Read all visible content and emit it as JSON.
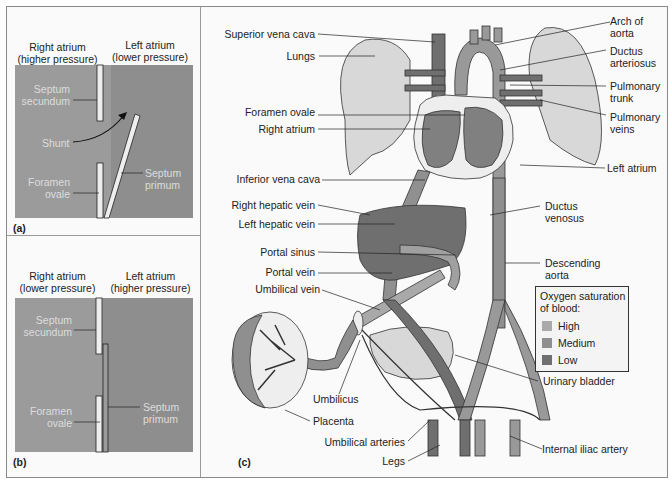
{
  "colors": {
    "high": "#a9a9a9",
    "medium": "#8f8f8f",
    "low": "#6f6f6f",
    "panel_bg_light": "#9d9d9d",
    "panel_bg_dark": "#858585",
    "lung": "#d8d8d8",
    "septum": "#eeeeee",
    "line": "#333333"
  },
  "panel_a": {
    "tag": "(a)",
    "right_atrium": [
      "Right atrium",
      "(higher pressure)"
    ],
    "left_atrium": [
      "Left atrium",
      "(lower pressure)"
    ],
    "septum_secundum": [
      "Septum",
      "secundum"
    ],
    "shunt": "Shunt",
    "foramen_ovale": [
      "Foramen",
      "ovale"
    ],
    "septum_primum": [
      "Septum",
      "primum"
    ]
  },
  "panel_b": {
    "tag": "(b)",
    "right_atrium": [
      "Right atrium",
      "(lower pressure)"
    ],
    "left_atrium": [
      "Left atrium",
      "(higher pressure)"
    ],
    "septum_secundum": [
      "Septum",
      "secundum"
    ],
    "foramen_ovale": [
      "Foramen",
      "ovale"
    ],
    "septum_primum": [
      "Septum",
      "primum"
    ]
  },
  "panel_c": {
    "tag": "(c)",
    "left_labels": {
      "superior_vena_cava": "Superior vena cava",
      "lungs": "Lungs",
      "foramen_ovale": "Foramen ovale",
      "right_atrium": "Right atrium",
      "inferior_vena_cava": "Inferior vena cava",
      "right_hepatic_vein": "Right hepatic vein",
      "left_hepatic_vein": "Left hepatic vein",
      "portal_sinus": "Portal sinus",
      "portal_vein": "Portal vein",
      "umbilical_vein": "Umbilical vein",
      "umbilicus": "Umbilicus",
      "placenta": "Placenta",
      "umbilical_arteries": "Umbilical arteries",
      "legs": "Legs"
    },
    "right_labels": {
      "arch_of_aorta": [
        "Arch of",
        "aorta"
      ],
      "ductus_arteriosus": [
        "Ductus",
        "arteriosus"
      ],
      "pulmonary_trunk": [
        "Pulmonary",
        "trunk"
      ],
      "pulmonary_veins": [
        "Pulmonary",
        "veins"
      ],
      "left_atrium": "Left atrium",
      "ductus_venosus": [
        "Ductus",
        "venosus"
      ],
      "descending_aorta": [
        "Descending",
        "aorta"
      ],
      "urinary_bladder": "Urinary bladder",
      "internal_iliac_artery": "Internal iliac artery"
    },
    "legend": {
      "title": [
        "Oxygen saturation",
        "of blood:"
      ],
      "items": [
        {
          "label": "High",
          "color": "#a9a9a9"
        },
        {
          "label": "Medium",
          "color": "#8f8f8f"
        },
        {
          "label": "Low",
          "color": "#6f6f6f"
        }
      ]
    }
  }
}
